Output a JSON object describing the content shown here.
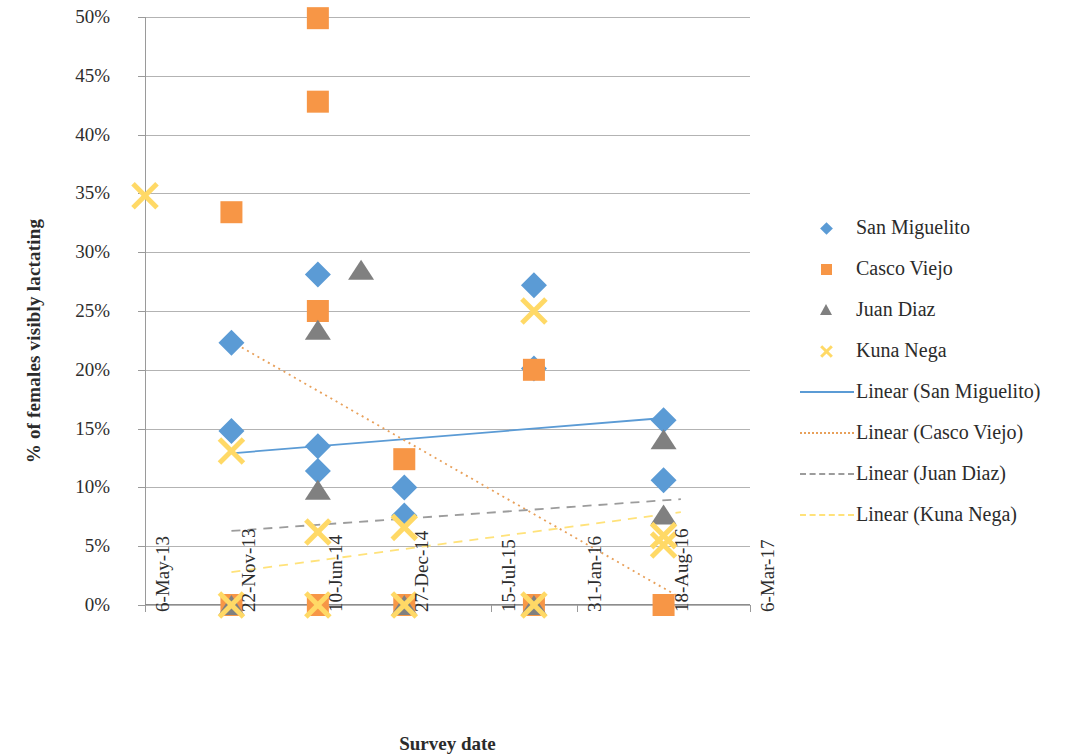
{
  "chart_data": {
    "type": "scatter",
    "title": "",
    "xlabel": "Survey date",
    "ylabel": "% of females visibly lactating",
    "x_tick_labels": [
      "6-May-13",
      "22-Nov-13",
      "10-Jun-14",
      "27-Dec-14",
      "15-Jul-15",
      "31-Jan-16",
      "18-Aug-16",
      "6-Mar-17"
    ],
    "y_tick_labels": [
      "0%",
      "5%",
      "10%",
      "15%",
      "20%",
      "25%",
      "30%",
      "35%",
      "40%",
      "45%",
      "50%"
    ],
    "ylim": [
      0,
      50
    ],
    "xlim": [
      0,
      7
    ],
    "grid": "horizontal",
    "legend_position": "right",
    "colors": {
      "san_miguelito": "#5B9BD5",
      "casco_viejo": "#F79646",
      "juan_diaz": "#808080",
      "kuna_nega": "#FFD966",
      "gridline": "#9A9A9A",
      "text": "#2B2B2B"
    },
    "series": [
      {
        "name": "San Miguelito",
        "marker": "diamond",
        "color": "#5B9BD5",
        "points": [
          {
            "x": 1.0,
            "y": 22.3
          },
          {
            "x": 1.0,
            "y": 14.8
          },
          {
            "x": 2.0,
            "y": 28.1
          },
          {
            "x": 2.0,
            "y": 13.5
          },
          {
            "x": 2.0,
            "y": 11.4
          },
          {
            "x": 3.0,
            "y": 10.0
          },
          {
            "x": 3.0,
            "y": 7.6
          },
          {
            "x": 4.5,
            "y": 27.2
          },
          {
            "x": 4.5,
            "y": 20.1
          },
          {
            "x": 6.0,
            "y": 15.7
          },
          {
            "x": 6.0,
            "y": 10.6
          }
        ]
      },
      {
        "name": "Casco Viejo",
        "marker": "square",
        "color": "#F79646",
        "points": [
          {
            "x": 1.0,
            "y": 33.4
          },
          {
            "x": 1.0,
            "y": 0.0
          },
          {
            "x": 2.0,
            "y": 49.9
          },
          {
            "x": 2.0,
            "y": 42.8
          },
          {
            "x": 2.0,
            "y": 25.0
          },
          {
            "x": 2.0,
            "y": 0.0
          },
          {
            "x": 3.0,
            "y": 12.4
          },
          {
            "x": 3.0,
            "y": 0.0
          },
          {
            "x": 4.5,
            "y": 20.0
          },
          {
            "x": 4.5,
            "y": 0.0
          },
          {
            "x": 6.0,
            "y": 0.0
          }
        ]
      },
      {
        "name": "Juan Diaz",
        "marker": "triangle",
        "color": "#808080",
        "points": [
          {
            "x": 1.0,
            "y": 0.0
          },
          {
            "x": 2.0,
            "y": 23.4
          },
          {
            "x": 2.0,
            "y": 9.8
          },
          {
            "x": 2.5,
            "y": 28.5
          },
          {
            "x": 3.0,
            "y": 0.0
          },
          {
            "x": 4.5,
            "y": 0.0
          },
          {
            "x": 6.0,
            "y": 14.1
          },
          {
            "x": 6.0,
            "y": 7.7
          }
        ]
      },
      {
        "name": "Kuna Nega",
        "marker": "cross",
        "color": "#FFD966",
        "points": [
          {
            "x": 0.0,
            "y": 34.8
          },
          {
            "x": 1.0,
            "y": 13.1
          },
          {
            "x": 1.0,
            "y": 0.0
          },
          {
            "x": 2.0,
            "y": 6.2
          },
          {
            "x": 2.0,
            "y": 0.0
          },
          {
            "x": 3.0,
            "y": 6.6
          },
          {
            "x": 3.0,
            "y": 0.0
          },
          {
            "x": 4.5,
            "y": 25.0
          },
          {
            "x": 4.5,
            "y": 0.0
          },
          {
            "x": 6.0,
            "y": 5.9
          },
          {
            "x": 6.0,
            "y": 5.1
          }
        ]
      }
    ],
    "trendlines": [
      {
        "name": "Linear (San Miguelito)",
        "color": "#5B9BD5",
        "style": "solid",
        "x0": 1.0,
        "y0": 12.9,
        "x1": 6.0,
        "y1": 15.9
      },
      {
        "name": "Linear (Casco Viejo)",
        "color": "#E8A05A",
        "style": "dotted",
        "x0": 1.0,
        "y0": 22.4,
        "x1": 6.2,
        "y1": 0.6
      },
      {
        "name": "Linear (Juan Diaz)",
        "color": "#9C9C9C",
        "style": "dashed",
        "x0": 1.0,
        "y0": 6.3,
        "x1": 6.2,
        "y1": 9.0
      },
      {
        "name": "Linear (Kuna Nega)",
        "color": "#FFE27A",
        "style": "dashed",
        "x0": 1.0,
        "y0": 2.8,
        "x1": 6.2,
        "y1": 7.9
      }
    ],
    "legend_entries": [
      {
        "label": "San Miguelito",
        "kind": "marker",
        "marker": "diamond",
        "color": "#5B9BD5"
      },
      {
        "label": "Casco Viejo",
        "kind": "marker",
        "marker": "square",
        "color": "#F79646"
      },
      {
        "label": "Juan Diaz",
        "kind": "marker",
        "marker": "triangle",
        "color": "#808080"
      },
      {
        "label": "Kuna Nega",
        "kind": "marker",
        "marker": "cross",
        "color": "#FFD966"
      },
      {
        "label": "Linear (San Miguelito)",
        "kind": "line",
        "style": "solid",
        "color": "#5B9BD5"
      },
      {
        "label": "Linear (Casco Viejo)",
        "kind": "line",
        "style": "dotted",
        "color": "#E8A05A"
      },
      {
        "label": "Linear (Juan Diaz)",
        "kind": "line",
        "style": "dashed",
        "color": "#9C9C9C"
      },
      {
        "label": "Linear (Kuna Nega)",
        "kind": "line",
        "style": "dashed",
        "color": "#FFE27A"
      }
    ]
  }
}
